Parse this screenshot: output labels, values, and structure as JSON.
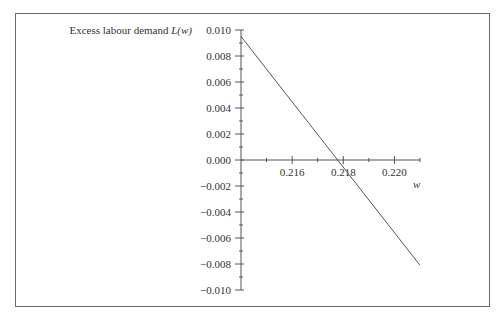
{
  "chart_data": {
    "type": "line",
    "title": "",
    "ylabel": "Excess labour demand L(w)",
    "ylabel_text": "Excess labour demand ",
    "ylabel_math": "L(w)",
    "xlabel": "w",
    "xlim": [
      0.214,
      0.221
    ],
    "ylim": [
      -0.01,
      0.01
    ],
    "x_ticks": [
      "0.216",
      "0.218",
      "0.220"
    ],
    "x_tick_values": [
      0.216,
      0.218,
      0.22
    ],
    "x_minor_ticks": [
      0.215,
      0.217,
      0.219,
      0.221
    ],
    "y_ticks": [
      "0.010",
      "0.008",
      "0.006",
      "0.004",
      "0.002",
      "0.000",
      "−0.002",
      "−0.004",
      "−0.006",
      "−0.008",
      "−0.010"
    ],
    "y_tick_values": [
      0.01,
      0.008,
      0.006,
      0.004,
      0.002,
      0.0,
      -0.002,
      -0.004,
      -0.006,
      -0.008,
      -0.01
    ],
    "grid": false,
    "legend": null,
    "series": [
      {
        "name": "L(w)",
        "x": [
          0.214,
          0.221
        ],
        "y": [
          0.0095,
          -0.0081
        ]
      }
    ],
    "annotations": [
      {
        "text": "zero crossing",
        "x": 0.2176,
        "y": 0.0
      }
    ]
  }
}
